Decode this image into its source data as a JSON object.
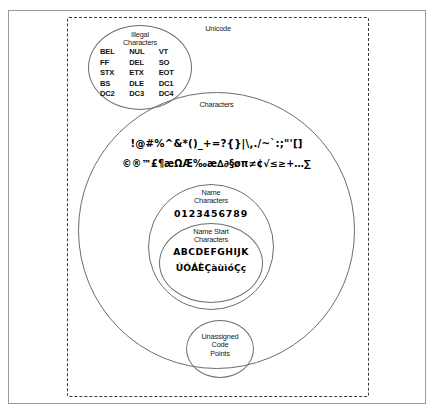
{
  "diagram": {
    "title": "Unicode",
    "sets": {
      "unicode": {
        "label": "Unicode",
        "shape": "dashed-rectangle"
      },
      "illegal_characters": {
        "label": "Illegal\nCharacters",
        "label_line1": "Illegal",
        "label_line2": "Characters",
        "members": [
          "BEL",
          "NUL",
          "VT",
          "FF",
          "DEL",
          "SO",
          "STX",
          "ETX",
          "EOT",
          "BS",
          "DLE",
          "DC1",
          "DC2",
          "DC3",
          "DC4"
        ]
      },
      "characters": {
        "label": "Characters",
        "symbols_row_1": "!@#%^&*()_+=?{}|\\,./~`:;\"'[]",
        "symbols_row_2": "©®™£¶æΩÆ‰æ∆∂§øπ≠¢√≤≥+…∑"
      },
      "name_characters": {
        "label_line1": "Name",
        "label_line2": "Characters",
        "members": "0123456789"
      },
      "name_start_characters": {
        "label_line1": "Name Start",
        "label_line2": "Characters",
        "members_row_1": "ABCDEFGHIJK",
        "members_row_2": "ÚÓÁÈÇàùìóÇç"
      },
      "unassigned_code_points": {
        "label_line1": "Unassigned",
        "label_line2": "Code",
        "label_line3": "Points"
      }
    },
    "colors": {
      "frame": "#9b9b9b",
      "dashed_border": "#3a3a3a",
      "circle_stroke": "#6d6d6d",
      "text": "#1a1a1a",
      "symbol_text": "#000000",
      "background": "#ffffff"
    }
  }
}
